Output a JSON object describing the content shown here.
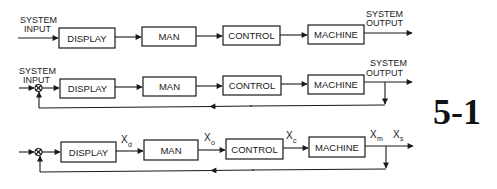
{
  "figure": {
    "number": "5-1",
    "colors": {
      "ink": "#1a1a1a",
      "background": "#ffffff"
    }
  },
  "row1": {
    "input_label_line1": "SYSTEM",
    "input_label_line2": "INPUT",
    "output_label_line1": "SYSTEM",
    "output_label_line2": "OUTPUT",
    "blocks": [
      "DISPLAY",
      "MAN",
      "CONTROL",
      "MACHINE"
    ]
  },
  "row2": {
    "input_label_line1": "SYSTEM",
    "input_label_line2": "INPUT",
    "output_label_line1": "SYSTEM",
    "output_label_line2": "OUTPUT",
    "blocks": [
      "DISPLAY",
      "MAN",
      "CONTROL",
      "MACHINE"
    ],
    "summing_junction": "⊗",
    "feedback": "unity feedback from system output to summing junction"
  },
  "row3": {
    "blocks": [
      "DISPLAY",
      "MAN",
      "CONTROL",
      "MACHINE"
    ],
    "signals": [
      {
        "base": "X",
        "sub": "d"
      },
      {
        "base": "X",
        "sub": "o"
      },
      {
        "base": "X",
        "sub": "c"
      },
      {
        "base": "X",
        "sub": "m"
      },
      {
        "base": "X",
        "sub": "s"
      }
    ],
    "summing_junction": "⊗"
  }
}
